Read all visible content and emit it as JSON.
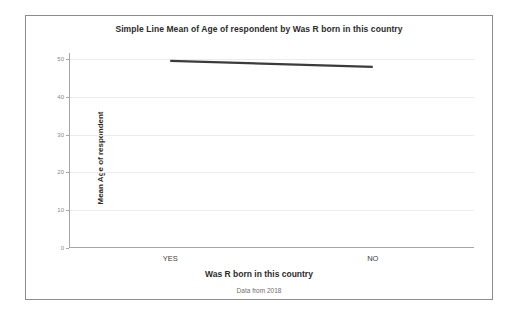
{
  "chart_data": {
    "type": "line",
    "title": "Simple Line Mean of Age of respondent by Was R born in this country",
    "xlabel": "Was R born in this country",
    "ylabel": "Mean Age of respondent",
    "footnote": "Data from 2018",
    "categories": [
      "YES",
      "NO"
    ],
    "values": [
      49.5,
      47.9
    ],
    "series": [
      {
        "name": "Mean Age of respondent",
        "values": [
          49.5,
          47.9
        ]
      }
    ],
    "ylim": [
      0,
      50
    ],
    "yticks": [
      0,
      10,
      20,
      30,
      40,
      50
    ],
    "ytick_labels": [
      "0",
      "10",
      "20",
      "30",
      "40",
      "50"
    ],
    "grid": true,
    "legend": false,
    "line_color": "#3b3b3b",
    "grid_color": "#ececec",
    "axis_color": "#a6a6a6",
    "border_color": "#8c8c8c",
    "background": "#ffffff"
  }
}
